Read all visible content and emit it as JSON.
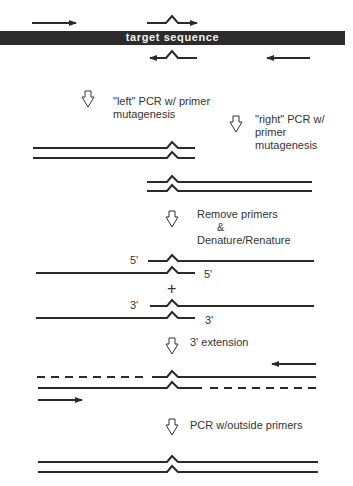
{
  "title_bar": {
    "label": "target sequence",
    "color": "#2b2b2b"
  },
  "steps": [
    {
      "id": "left-pcr",
      "label_line1": "\"left\" PCR w/ primer",
      "label_line2": "mutagenesis"
    },
    {
      "id": "right-pcr",
      "label_line1": "\"right\" PCR w/",
      "label_line2": "primer",
      "label_line3": "mutagenesis"
    },
    {
      "id": "remove-primers",
      "label_line1": "Remove primers",
      "label_line2": "&",
      "label_line3": "Denature/Renature"
    },
    {
      "id": "extension",
      "label_line1": "3' extension"
    },
    {
      "id": "outside-pcr",
      "label_line1": "PCR w/outside primers"
    }
  ],
  "strand_ends": {
    "top_pair_left": "5'",
    "top_pair_right": "5'",
    "plus": "+",
    "bottom_pair_left": "3'",
    "bottom_pair_right": "3'"
  },
  "icons": {
    "step_arrow": "hollow-down-arrow-icon",
    "primer_arrow": "primer-arrow-icon",
    "mutation_bump": "mutation-caret-icon"
  },
  "colors": {
    "line": "#2a2a2a",
    "text": "#333333",
    "background": "#ffffff"
  }
}
